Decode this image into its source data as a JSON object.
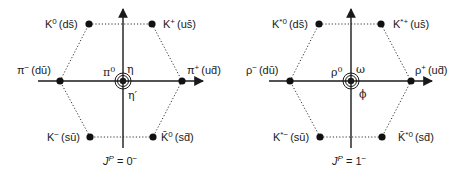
{
  "diagrams": [
    {
      "id": "pseudoscalar",
      "caption": {
        "j": "J",
        "p": "P",
        "eq": " = 0",
        "sup": "−"
      },
      "center_labels": {
        "left": "π",
        "left_sup": "0",
        "upper_right": "η",
        "lower_right": "η′"
      },
      "nodes": {
        "top_left": {
          "name": "K",
          "sup": "0",
          "quark": "(ds̄)"
        },
        "top_right": {
          "name": "K",
          "sup": "+",
          "quark": "(us̄)"
        },
        "mid_left": {
          "name": "π",
          "sup": "−",
          "quark": "(dū)"
        },
        "mid_right": {
          "name": "π",
          "sup": "+",
          "quark": "(ud̄)"
        },
        "bottom_left": {
          "name": "K",
          "sup": "−",
          "quark": "(sū)"
        },
        "bottom_right": {
          "name": "K̄",
          "sup": "0",
          "quark": "(sd̄)"
        }
      }
    },
    {
      "id": "vector",
      "caption": {
        "j": "J",
        "p": "P",
        "eq": " = 1",
        "sup": "−"
      },
      "center_labels": {
        "left": "ρ",
        "left_sup": "0",
        "upper_right": "ω",
        "lower_right": "ϕ"
      },
      "nodes": {
        "top_left": {
          "name": "K",
          "sup": "*0",
          "quark": "(ds̄)"
        },
        "top_right": {
          "name": "K",
          "sup": "*+",
          "quark": "(us̄)"
        },
        "mid_left": {
          "name": "ρ",
          "sup": "−",
          "quark": "(dū)"
        },
        "mid_right": {
          "name": "ρ",
          "sup": "+",
          "quark": "(ud̄)"
        },
        "bottom_left": {
          "name": "K",
          "sup": "*−",
          "quark": "(sū)"
        },
        "bottom_right": {
          "name": "K̄",
          "sup": "*0",
          "quark": "(sd̄)"
        }
      }
    }
  ],
  "colors": {
    "line": "#1a1a1a",
    "dotted": "#333333",
    "phi": "#8a8a8a"
  }
}
